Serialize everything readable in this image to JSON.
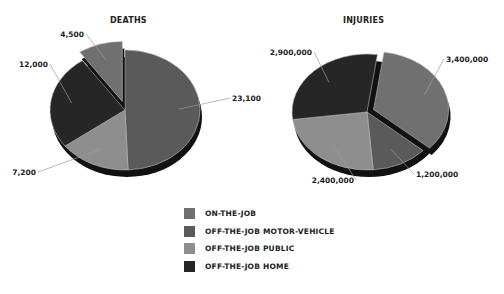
{
  "colors": {
    "on_the_job": "#707070",
    "off_the_job_motor_vehicle": "#5a5a5a",
    "off_the_job_public": "#8e8e8e",
    "off_the_job_home": "#262626",
    "shadow": "#111111"
  },
  "legend": [
    {
      "key": "on_the_job",
      "label": "ON-THE-JOB",
      "color": "#707070"
    },
    {
      "key": "off_the_job_motor_vehicle",
      "label": "OFF-THE-JOB MOTOR-VEHICLE",
      "color": "#5a5a5a"
    },
    {
      "key": "off_the_job_public",
      "label": "OFF-THE-JOB PUBLIC",
      "color": "#8e8e8e"
    },
    {
      "key": "off_the_job_home",
      "label": "OFF-THE-JOB HOME",
      "color": "#262626"
    }
  ],
  "chart_data": [
    {
      "type": "pie",
      "title": "DEATHS",
      "categories": [
        "ON-THE-JOB",
        "OFF-THE-JOB MOTOR-VEHICLE",
        "OFF-THE-JOB PUBLIC",
        "OFF-THE-JOB HOME"
      ],
      "values": [
        4500,
        23100,
        7200,
        12000
      ],
      "value_labels": [
        "4,500",
        "23,100",
        "7,200",
        "12,000"
      ],
      "exploded": [
        "ON-THE-JOB"
      ],
      "style": "3d-tilted"
    },
    {
      "type": "pie",
      "title": "INJURIES",
      "categories": [
        "ON-THE-JOB",
        "OFF-THE-JOB MOTOR-VEHICLE",
        "OFF-THE-JOB PUBLIC",
        "OFF-THE-JOB HOME"
      ],
      "values": [
        3400000,
        1200000,
        2400000,
        2900000
      ],
      "value_labels": [
        "3,400,000",
        "1,200,000",
        "2,400,000",
        "2,900,000"
      ],
      "exploded": [
        "ON-THE-JOB"
      ],
      "style": "3d-tilted"
    }
  ]
}
